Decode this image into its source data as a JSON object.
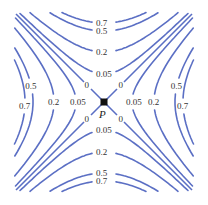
{
  "chart_data": {
    "type": "contour",
    "title": "",
    "center": {
      "x": 104,
      "y": 102
    },
    "point_label": "P",
    "line_color": "#5b6fc4",
    "asymptote_level": "0",
    "levels": [
      {
        "label": "0.05",
        "offset": 28
      },
      {
        "label": "0.2",
        "offset": 50
      },
      {
        "label": "0.5",
        "offset": 71
      },
      {
        "label": "0.7",
        "offset": 79
      }
    ],
    "regions": [
      "top",
      "bottom",
      "left",
      "right"
    ],
    "labels": {
      "top": [
        "0.7",
        "0.5",
        "0.2",
        "0.05"
      ],
      "bottom": [
        "0.05",
        "0.2",
        "0.5",
        "0.7"
      ],
      "left": [
        "0.7",
        "0.5",
        "0.2",
        "0.05"
      ],
      "right": [
        "0.05",
        "0.2",
        "0.5",
        "0.7"
      ],
      "zeros": [
        "0",
        "0",
        "0",
        "0"
      ]
    }
  }
}
